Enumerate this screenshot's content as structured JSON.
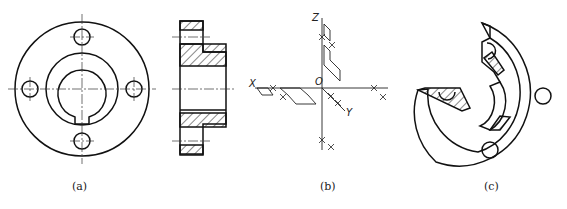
{
  "header": {
    "cropped_text": ""
  },
  "figures": [
    {
      "id": "a",
      "caption": "(a)",
      "description": "flange front view with four bolt holes and keyed bore"
    },
    {
      "id": "b_section",
      "caption": "",
      "description": "sectional side view of flange with hatching"
    },
    {
      "id": "b",
      "caption": "(b)",
      "description": "oblique axis construction",
      "axes": {
        "x": "X",
        "y": "Y",
        "z": "Z",
        "origin": "O"
      }
    },
    {
      "id": "c",
      "caption": "(c)",
      "description": "isometric view of cut-away flange"
    }
  ],
  "colors": {
    "line": "#111111",
    "centerline": "#333333",
    "background": "#ffffff"
  }
}
